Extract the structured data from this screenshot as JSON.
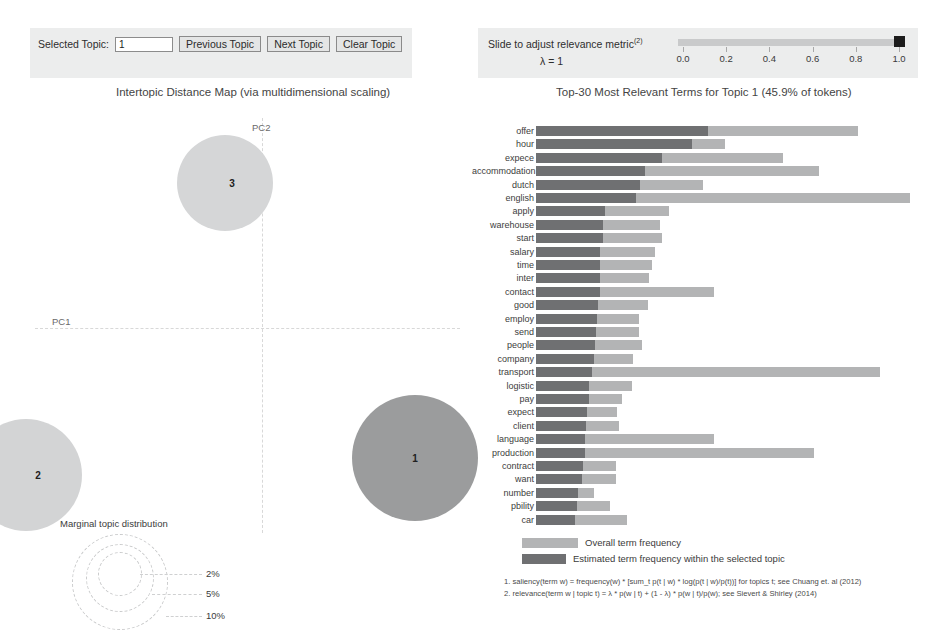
{
  "topic_controls": {
    "label": "Selected Topic:",
    "value": "1",
    "prev_label": "Previous Topic",
    "next_label": "Next Topic",
    "clear_label": "Clear Topic"
  },
  "lambda_controls": {
    "text": "Slide to adjust relevance metric",
    "superscript": "(2)",
    "value_text": "λ = 1",
    "lambda": 1.0,
    "ticks": [
      "0.0",
      "0.2",
      "0.4",
      "0.6",
      "0.8",
      "1.0"
    ]
  },
  "left_panel": {
    "title": "Intertopic Distance Map (via multidimensional scaling)",
    "x_axis_label": "PC1",
    "y_axis_label": "PC2",
    "bubbles": [
      {
        "id": "1",
        "label": "1",
        "selected": true
      },
      {
        "id": "2",
        "label": "2",
        "selected": false
      },
      {
        "id": "3",
        "label": "3",
        "selected": false
      }
    ],
    "marginal": {
      "title": "Marginal topic distribution",
      "sizes": [
        "2%",
        "5%",
        "10%"
      ]
    }
  },
  "right_panel": {
    "title": "Top-30 Most Relevant Terms for Topic 1 (45.9% of tokens)",
    "legend": {
      "overall": "Overall term frequency",
      "estimated": "Estimated term frequency within the selected topic"
    },
    "notes": [
      "1. saliency(term w) = frequency(w) * [sum_t p(t | w) * log(p(t | w)/p(t))] for topics t; see Chuang et. al (2012)",
      "2. relevance(term w | topic t) = λ * p(w | t) + (1 - λ) * p(w | t)/p(w); see Sievert & Shirley (2014)"
    ]
  },
  "colors": {
    "bar_overall": "#b3b4b5",
    "bar_estimated": "#6f7072",
    "bubble_selected": "#9b9c9d",
    "bubble_default": "#d5d6d7",
    "panel_band": "#eceded"
  },
  "chart_data": {
    "type": "bar",
    "title": "Top-30 Most Relevant Terms for Topic 1 (45.9% of tokens)",
    "xlabel": "",
    "ylabel": "",
    "orientation": "horizontal",
    "grid": false,
    "legend_position": "bottom",
    "xlim": [
      0,
      360
    ],
    "categories": [
      "offer",
      "hour",
      "expece",
      "accommodation",
      "dutch",
      "english",
      "apply",
      "warehouse",
      "start",
      "salary",
      "time",
      "inter",
      "contact",
      "good",
      "employ",
      "send",
      "people",
      "company",
      "transport",
      "logistic",
      "pay",
      "expect",
      "client",
      "language",
      "production",
      "contract",
      "want",
      "number",
      "pbility",
      "car"
    ],
    "series": [
      {
        "name": "Overall term frequency",
        "values": [
          290,
          170,
          222,
          255,
          150,
          337,
          120,
          112,
          113,
          107,
          104,
          102,
          160,
          101,
          93,
          93,
          95,
          87,
          310,
          86,
          77,
          73,
          75,
          160,
          250,
          72,
          72,
          52,
          67,
          82
        ]
      },
      {
        "name": "Estimated term frequency within the selected topic",
        "values": [
          155,
          140,
          113,
          98,
          94,
          90,
          62,
          60,
          60,
          58,
          58,
          58,
          58,
          56,
          55,
          54,
          53,
          52,
          50,
          48,
          48,
          46,
          45,
          44,
          44,
          42,
          41,
          38,
          37,
          35
        ]
      }
    ]
  }
}
